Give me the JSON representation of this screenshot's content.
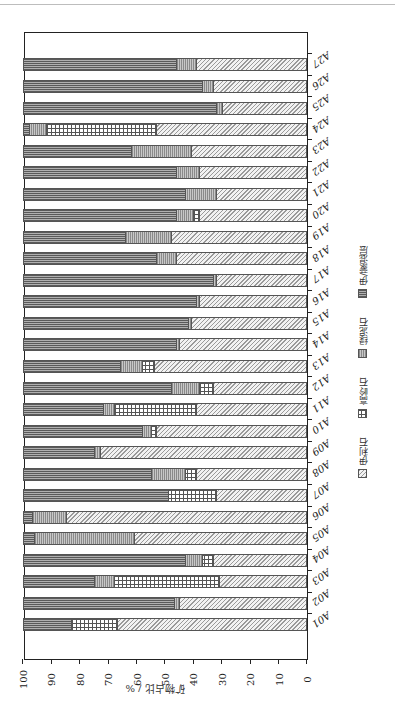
{
  "chart_data": {
    "type": "bar",
    "orientation": "horizontal-stacked",
    "rotation_in_image": 180,
    "title": "",
    "xlabel": "矿物占比 / %",
    "ylabel": "",
    "xlim": [
      0,
      100
    ],
    "x_ticks": [
      0,
      10,
      20,
      30,
      40,
      50,
      60,
      70,
      80,
      90,
      100
    ],
    "grid": false,
    "legend_position": "right (rotated, vertical text)",
    "categories": [
      "A01",
      "A02",
      "A03",
      "A04",
      "A05",
      "A06",
      "A07",
      "A08",
      "A09",
      "A10",
      "A11",
      "A12",
      "A13",
      "A14",
      "A15",
      "A16",
      "A17",
      "A18",
      "A19",
      "A20",
      "A21",
      "A22",
      "A23",
      "A24",
      "A25",
      "A26",
      "A27"
    ],
    "series": [
      {
        "name": "伊利石",
        "pattern": "diagonal-hatch",
        "values": [
          67,
          45,
          31,
          33,
          61,
          85,
          32,
          39,
          73,
          53,
          39,
          33,
          54,
          45,
          41,
          38,
          32,
          46,
          48,
          38,
          32,
          38,
          41,
          53,
          30,
          33,
          39
        ]
      },
      {
        "name": "高岭石",
        "pattern": "grid",
        "values": [
          16,
          0,
          37,
          4,
          0,
          0,
          17,
          4,
          0,
          2,
          29,
          5,
          4,
          0,
          0,
          0,
          0,
          0,
          0,
          2,
          0,
          0,
          0,
          39,
          0,
          0,
          0
        ]
      },
      {
        "name": "绿泥石",
        "pattern": "vertical-lines",
        "values": [
          0,
          2,
          7,
          6,
          35,
          12,
          0,
          12,
          2,
          3,
          4,
          10,
          8,
          1,
          1,
          1,
          1,
          7,
          16,
          6,
          11,
          8,
          21,
          6,
          2,
          4,
          7
        ]
      },
      {
        "name": "伊/蒙混层",
        "pattern": "horizontal-lines",
        "values": [
          17,
          53,
          25,
          57,
          4,
          3,
          51,
          45,
          25,
          42,
          28,
          52,
          34,
          54,
          58,
          61,
          67,
          47,
          36,
          54,
          57,
          54,
          38,
          2,
          68,
          63,
          54
        ]
      }
    ]
  },
  "legend": [
    {
      "label": "伊利石",
      "cls": "pat-illite"
    },
    {
      "label": "高岭石",
      "cls": "pat-kaolinite"
    },
    {
      "label": "绿泥石",
      "cls": "pat-chlorite"
    },
    {
      "label": "伊/蒙混层",
      "cls": "pat-is"
    }
  ]
}
